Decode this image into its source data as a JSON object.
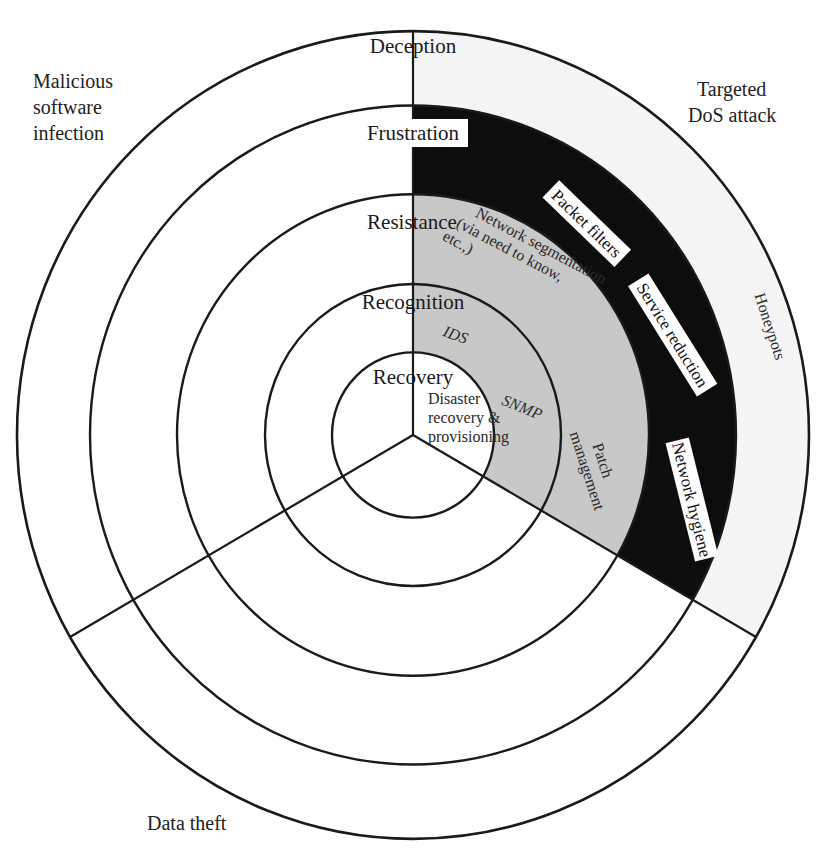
{
  "diagram": {
    "type": "concentric-ring-defense-model",
    "rings": [
      {
        "label": "Deception",
        "order": 1
      },
      {
        "label": "Frustration",
        "order": 2
      },
      {
        "label": "Resistance",
        "order": 3
      },
      {
        "label": "Recognition",
        "order": 4
      },
      {
        "label": "Recovery",
        "order": 5
      }
    ],
    "threats": {
      "top_left": [
        "Malicious",
        "software",
        "infection"
      ],
      "top_right": [
        "Targeted",
        "DoS attack"
      ],
      "bottom": "Data theft"
    },
    "sector_items": {
      "deception": [
        "Honeypots"
      ],
      "frustration": [
        "Packet filters",
        "Service reduction",
        "Network hygiene"
      ],
      "resistance": {
        "segmentation": [
          "Network segmentation",
          "(via need to know,",
          "etc.,)"
        ],
        "patch": [
          "Patch",
          "management"
        ]
      },
      "recognition": [
        "IDS",
        "SNMP"
      ],
      "recovery": [
        "Disaster",
        "recovery &",
        "provisioning"
      ]
    },
    "colors": {
      "deception_band": "#f5f5f5",
      "frustration_band": "#0d0d0d",
      "resistance_band": "#c8c8c8",
      "lines": "#1a1a1a",
      "label_box": "#ffffff"
    }
  }
}
